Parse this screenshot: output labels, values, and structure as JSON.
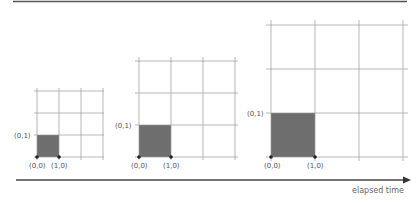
{
  "diagram": {
    "title_rule": true,
    "axis_label": "elapsed time",
    "colors": {
      "grid": "#9a9a9a",
      "cell_fill": "#6e6e6e",
      "axis": "#444444",
      "text": "#555555",
      "rule": "#555555"
    },
    "panels": [
      {
        "name": "panel-small",
        "labels": {
          "origin": "(0,0)",
          "x_unit": "(1,0)",
          "y_unit": "(0,1)"
        }
      },
      {
        "name": "panel-medium",
        "labels": {
          "origin": "(0,0)",
          "x_unit": "(1,0)",
          "y_unit": "(0,1)"
        }
      },
      {
        "name": "panel-large",
        "labels": {
          "origin": "(0,0)",
          "x_unit": "(1,0)",
          "y_unit": "(0,1)"
        }
      }
    ]
  }
}
